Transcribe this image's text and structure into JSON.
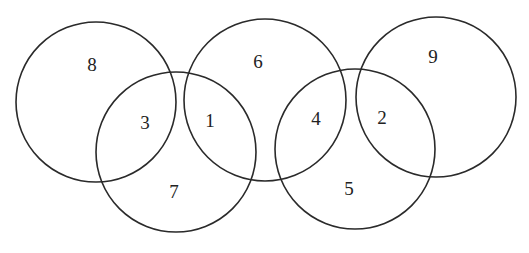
{
  "diagram": {
    "type": "five-ring-number-puzzle",
    "circles": [
      {
        "id": "ring-1",
        "cx": 96,
        "cy": 102,
        "r": 80
      },
      {
        "id": "ring-2",
        "cx": 176,
        "cy": 152,
        "r": 80
      },
      {
        "id": "ring-3",
        "cx": 265,
        "cy": 100,
        "r": 81
      },
      {
        "id": "ring-4",
        "cx": 355,
        "cy": 149,
        "r": 80
      },
      {
        "id": "ring-5",
        "cx": 436,
        "cy": 97,
        "r": 80
      }
    ],
    "labels": [
      {
        "text": "8",
        "x": 92,
        "y": 64
      },
      {
        "text": "3",
        "x": 145,
        "y": 122
      },
      {
        "text": "7",
        "x": 174,
        "y": 191
      },
      {
        "text": "1",
        "x": 210,
        "y": 120
      },
      {
        "text": "6",
        "x": 258,
        "y": 61
      },
      {
        "text": "4",
        "x": 316,
        "y": 118
      },
      {
        "text": "5",
        "x": 349,
        "y": 188
      },
      {
        "text": "2",
        "x": 382,
        "y": 117
      },
      {
        "text": "9",
        "x": 433,
        "y": 56
      }
    ],
    "stroke_color": "#2a2a2a"
  }
}
